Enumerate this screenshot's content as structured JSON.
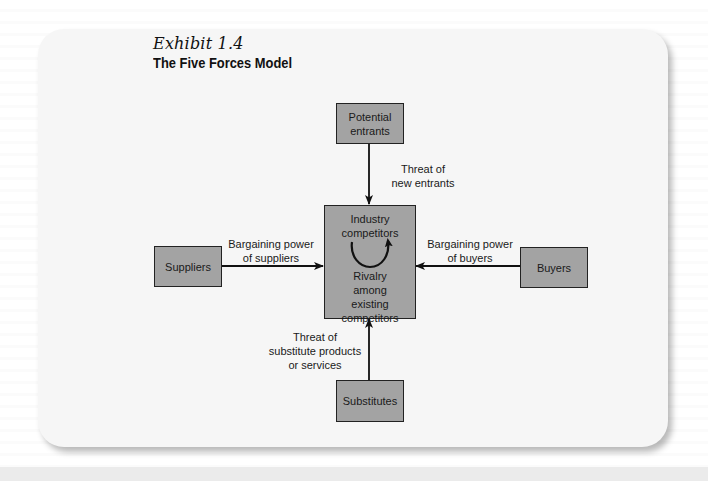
{
  "exhibit": {
    "label": "Exhibit 1.4",
    "title": "The Five Forces Model"
  },
  "diagram": {
    "nodes": {
      "potential_entrants": "Potential entrants",
      "industry_competitors_top": "Industry competitors",
      "industry_competitors_bottom": "Rivalry among existing competitors",
      "suppliers": "Suppliers",
      "buyers": "Buyers",
      "substitutes": "Substitutes"
    },
    "edges": {
      "new_entrants": {
        "line1": "Threat of",
        "line2": "new entrants"
      },
      "suppliers": {
        "line1": "Bargaining power",
        "line2": "of suppliers"
      },
      "buyers": {
        "line1": "Bargaining power",
        "line2": "of buyers"
      },
      "substitutes": {
        "line1": "Threat of",
        "line2": "substitute products",
        "line3": "or services"
      }
    }
  },
  "colors": {
    "box_fill": "#a3a3a3",
    "box_border": "#222222",
    "card_bg": "#f6f6f6"
  }
}
